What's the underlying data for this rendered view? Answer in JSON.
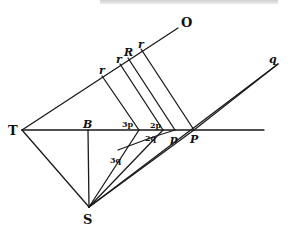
{
  "diagram": {
    "labels": {
      "O": "O",
      "q": "q",
      "r1": "r",
      "r2": "r",
      "R": "R",
      "r3": "r",
      "T": "T",
      "B": "B",
      "S": "S",
      "p3": "3p",
      "p2": "2p",
      "q2": "2q",
      "q3": "3q",
      "p": "p",
      "P": "P"
    },
    "points": {
      "T": [
        22,
        130
      ],
      "B": [
        88,
        130
      ],
      "S": [
        89,
        207
      ],
      "O": [
        178,
        28
      ],
      "q": [
        278,
        64
      ],
      "p3": [
        139,
        130
      ],
      "p2": [
        163,
        130
      ],
      "p": [
        175,
        130
      ],
      "P": [
        194,
        130
      ],
      "r_p": [
        102,
        76
      ],
      "r_r": [
        120,
        64
      ],
      "R": [
        128,
        58
      ],
      "r_top": [
        141,
        49
      ],
      "q2": [
        153,
        137
      ],
      "q3": [
        118,
        150
      ],
      "line_end": [
        264,
        130
      ]
    },
    "colors": {
      "ink": "#1a1a1a",
      "paper": "#ffffff"
    }
  }
}
